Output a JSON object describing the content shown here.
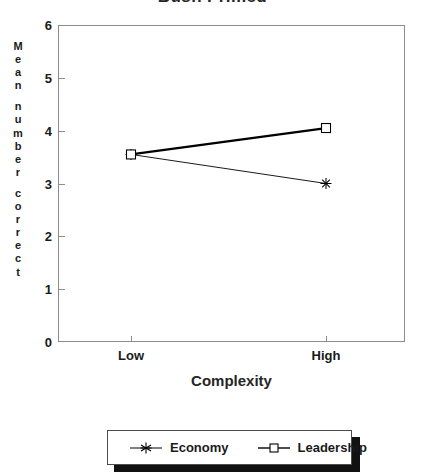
{
  "chart_data": {
    "type": "line",
    "title": "Bush Primed",
    "xlabel": "Complexity",
    "ylabel": "Mean number correct",
    "categories": [
      "Low",
      "High"
    ],
    "series": [
      {
        "name": "Economy",
        "values": [
          3.55,
          3.0
        ],
        "marker": "star",
        "line": "thin",
        "color": "#000000"
      },
      {
        "name": "Leadership",
        "values": [
          3.55,
          4.05
        ],
        "marker": "square",
        "line": "thick",
        "color": "#000000"
      }
    ],
    "ylim": [
      0,
      6
    ],
    "yticks": [
      "0",
      "1",
      "2",
      "3",
      "4",
      "5",
      "6"
    ],
    "grid": false,
    "legend_position": "bottom"
  },
  "axes": {
    "y_label_letters": [
      "M",
      "e",
      "a",
      "n",
      "",
      "n",
      "u",
      "m",
      "b",
      "e",
      "r",
      "",
      "c",
      "o",
      "r",
      "r",
      "e",
      "c",
      "t"
    ]
  },
  "legend": {
    "entries": [
      {
        "label": "Economy",
        "marker_icon": "star-marker-icon"
      },
      {
        "label": "Leadership",
        "marker_icon": "square-marker-icon"
      }
    ]
  }
}
